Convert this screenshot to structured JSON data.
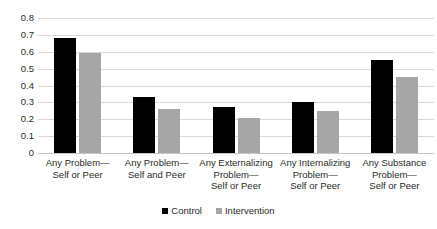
{
  "chart_data": {
    "type": "bar",
    "title": "",
    "subtitle": "",
    "xlabel": "",
    "ylabel": "",
    "ylim": [
      0,
      0.8
    ],
    "ytick_step": 0.1,
    "grid": true,
    "legend_position": "bottom-center",
    "categories": [
      "Any Problem—\nSelf or Peer",
      "Any Problem—\nSelf and Peer",
      "Any Externalizing\nProblem—\nSelf or Peer",
      "Any Internalizing\nProblem—\nSelf or Peer",
      "Any Substance\nProblem—\nSelf or Peer"
    ],
    "ytick_labels": [
      "0.8",
      "0.7",
      "0.6",
      "0.5",
      "0.4",
      "0.3",
      "0.2",
      "0.1",
      "0"
    ],
    "ytick_values": [
      0.8,
      0.7,
      0.6,
      0.5,
      0.4,
      0.3,
      0.2,
      0.1,
      0
    ],
    "series": [
      {
        "name": "Control",
        "color": "#000000",
        "values": [
          0.68,
          0.33,
          0.27,
          0.3,
          0.55
        ]
      },
      {
        "name": "Intervention",
        "color": "#a6a6a6",
        "values": [
          0.59,
          0.26,
          0.21,
          0.25,
          0.45
        ]
      }
    ]
  },
  "legend": {
    "items": [
      {
        "label": "Control",
        "color": "#000000"
      },
      {
        "label": "Intervention",
        "color": "#a6a6a6"
      }
    ]
  },
  "colors": {
    "background": "#ffffff",
    "gridline": "#d9d9d9",
    "baseline": "#c6c6c6",
    "text": "#2a2a2a"
  }
}
